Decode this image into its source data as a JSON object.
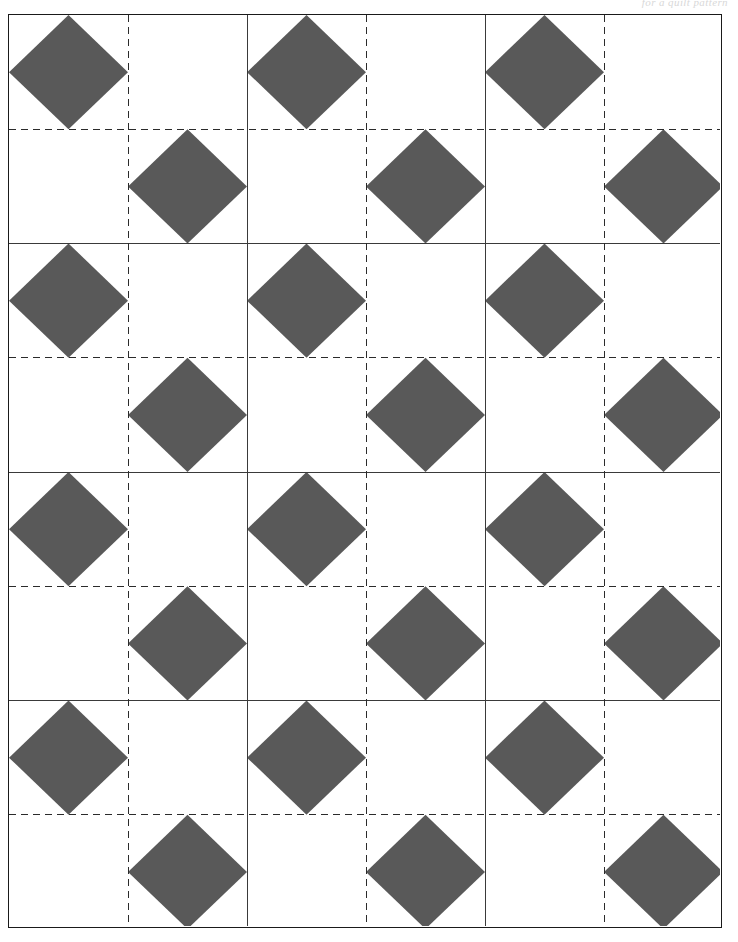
{
  "page": {
    "width": 738,
    "height": 942,
    "background_color": "#ffffff",
    "header_text": "for a quilt pattern"
  },
  "frame": {
    "x": 8,
    "y": 14,
    "width": 714,
    "height": 914,
    "border_color": "#1a1a1a",
    "border_width": 1.5
  },
  "pattern": {
    "name": "four-diamond-x-block-grid",
    "fill_color": "#595959",
    "background_color": "#ffffff",
    "solid_line_color": "#3a3a3a",
    "dashed_line_color": "#2b2b2b",
    "solid_line_width": 1,
    "dashed_line_width": 1,
    "dash_array": "7 5",
    "columns": 3,
    "rows": 4,
    "cell_width": 238,
    "cell_height": 228.5,
    "block_shape": "x-block-of-four-rotated-squares",
    "diamond_half_diagonal_x": 59.5,
    "diamond_half_diagonal_y": 57.125
  },
  "chart_data": {
    "type": "table",
    "categories": [
      "col-1",
      "col-2",
      "col-3"
    ],
    "values": [
      4,
      4,
      4
    ],
    "xlabel": "columns",
    "ylabel": "rows"
  }
}
